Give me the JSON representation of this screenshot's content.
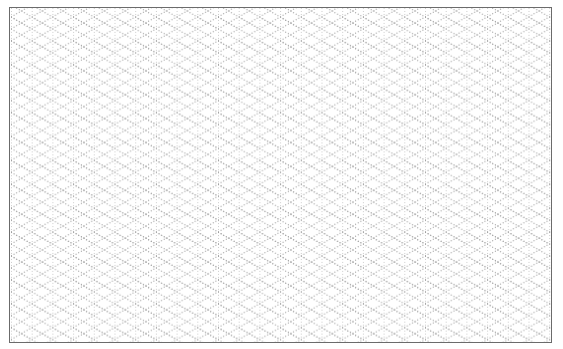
{
  "page": {
    "type": "isometric-grid-paper"
  },
  "grid": {
    "line_color": "#9a9a9a",
    "border_color": "#6b6b6b",
    "background": "#ffffff",
    "vertical_spacing_px": 20.7,
    "diagonal_angle_deg": 30,
    "line_style": "dotted"
  }
}
